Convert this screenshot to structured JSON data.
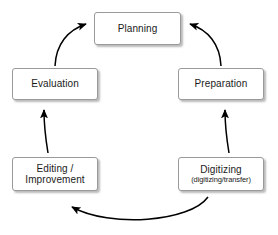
{
  "diagram": {
    "type": "cycle-flowchart",
    "title": "",
    "colors": {
      "background": "#ffffff",
      "node_fill": "#ffffff",
      "node_border": "#9a9a9a",
      "arrow": "#000000",
      "text": "#1a1a1a"
    },
    "nodes": [
      {
        "id": "planning",
        "label": "Planning",
        "sublabel": ""
      },
      {
        "id": "preparation",
        "label": "Preparation",
        "sublabel": ""
      },
      {
        "id": "digitizing",
        "label": "Digitizing",
        "sublabel": "(digitizing/transfer)"
      },
      {
        "id": "editing",
        "label": "Editing /\nImprovement",
        "sublabel": ""
      },
      {
        "id": "evaluation",
        "label": "Evaluation",
        "sublabel": ""
      }
    ],
    "edges": [
      {
        "id": "planning-to-preparation",
        "from": "planning",
        "to": "preparation"
      },
      {
        "id": "preparation-to-digitizing",
        "from": "preparation",
        "to": "digitizing"
      },
      {
        "id": "digitizing-to-editing",
        "from": "digitizing",
        "to": "editing"
      },
      {
        "id": "editing-to-evaluation",
        "from": "editing",
        "to": "evaluation"
      },
      {
        "id": "evaluation-to-planning",
        "from": "evaluation",
        "to": "planning"
      }
    ]
  }
}
